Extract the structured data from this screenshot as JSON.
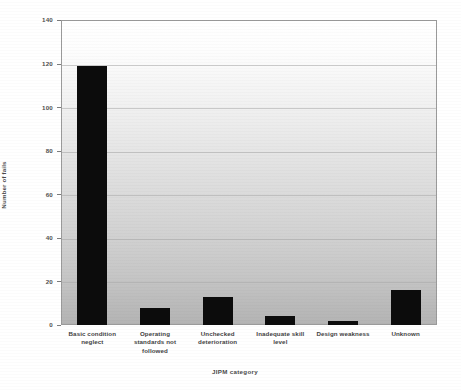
{
  "chart_data": {
    "type": "bar",
    "title": "",
    "xlabel": "JIPM category",
    "ylabel": "Number of fails",
    "categories": [
      "Basic condition neglect",
      "Operating standards not followed",
      "Unchecked deterioration",
      "Inadequate skill level",
      "Design weakness",
      "Unknown"
    ],
    "category_lines": [
      [
        "Basic condition",
        "neglect"
      ],
      [
        "Operating",
        "standards not",
        "followed"
      ],
      [
        "Unchecked",
        "deterioration"
      ],
      [
        "Inadequate skill",
        "level"
      ],
      [
        "Design weakness"
      ],
      [
        "Unknown"
      ]
    ],
    "values": [
      119,
      8,
      13,
      4,
      2,
      16
    ],
    "ylim": [
      0,
      140
    ],
    "yticks": [
      0,
      20,
      40,
      60,
      80,
      100,
      120,
      140
    ],
    "ytick_labels": [
      "0",
      "20",
      "40",
      "60",
      "80",
      "100",
      "120",
      "140"
    ],
    "grid": true,
    "legend": false,
    "bar_color": "#0c0c0c",
    "plot_bg_top": "#ffffff",
    "plot_bg_bottom": "#b4b4b4",
    "axis_color": "#9a9a9a"
  }
}
